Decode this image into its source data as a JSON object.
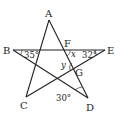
{
  "diagram": {
    "type": "pentagram-angle-problem",
    "points": {
      "A": "A",
      "B": "B",
      "C": "C",
      "D": "D",
      "E": "E",
      "F": "F",
      "G": "G"
    },
    "segments": [
      "AC",
      "AD",
      "BE",
      "BD",
      "CE"
    ],
    "angles": {
      "B": "35°",
      "E": "32°",
      "D": "30°",
      "x": "x",
      "y": "y"
    }
  }
}
